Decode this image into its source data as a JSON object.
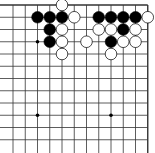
{
  "board": {
    "cols": 12,
    "rows": 12,
    "x0": 13,
    "y0": 5,
    "spacing": 12.25,
    "line_color": "#333333",
    "edges": {
      "top": true,
      "right": true,
      "left": false,
      "bottom": false
    },
    "star_points": [
      [
        2,
        3
      ],
      [
        2,
        9
      ],
      [
        8,
        9
      ]
    ],
    "stones": [
      {
        "c": 4,
        "r": 0,
        "color": "white"
      },
      {
        "c": 2,
        "r": 1,
        "color": "black"
      },
      {
        "c": 3,
        "r": 1,
        "color": "black"
      },
      {
        "c": 4,
        "r": 1,
        "color": "black"
      },
      {
        "c": 5,
        "r": 1,
        "color": "white"
      },
      {
        "c": 7,
        "r": 1,
        "color": "black"
      },
      {
        "c": 8,
        "r": 1,
        "color": "black"
      },
      {
        "c": 9,
        "r": 1,
        "color": "black"
      },
      {
        "c": 10,
        "r": 1,
        "color": "black"
      },
      {
        "c": 11,
        "r": 1,
        "color": "white"
      },
      {
        "c": 3,
        "r": 2,
        "color": "black"
      },
      {
        "c": 4,
        "r": 2,
        "color": "white"
      },
      {
        "c": 7,
        "r": 2,
        "color": "white"
      },
      {
        "c": 8,
        "r": 2,
        "color": "white"
      },
      {
        "c": 9,
        "r": 2,
        "color": "black"
      },
      {
        "c": 10,
        "r": 2,
        "color": "white"
      },
      {
        "c": 3,
        "r": 3,
        "color": "black"
      },
      {
        "c": 4,
        "r": 3,
        "color": "white"
      },
      {
        "c": 6,
        "r": 3,
        "color": "white"
      },
      {
        "c": 8,
        "r": 3,
        "color": "black"
      },
      {
        "c": 9,
        "r": 3,
        "color": "white"
      },
      {
        "c": 10,
        "r": 3,
        "color": "white"
      },
      {
        "c": 4,
        "r": 4,
        "color": "white"
      },
      {
        "c": 8,
        "r": 4,
        "color": "white"
      }
    ]
  }
}
